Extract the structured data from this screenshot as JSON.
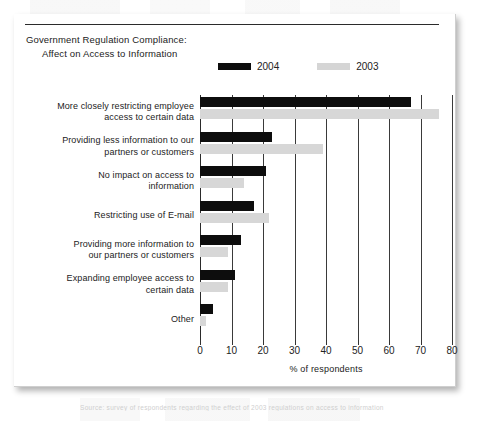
{
  "figure": {
    "title_line1": "Government Regulation Compliance:",
    "title_line2": "Affect on Access to Information",
    "caption": "Source: survey of respondents regarding the effect of 2003 regulations on access to information"
  },
  "legend": {
    "items": [
      {
        "label": "2004",
        "color": "#0d0d0d"
      },
      {
        "label": "2003",
        "color": "#d7d7d7"
      }
    ]
  },
  "chart_data": {
    "type": "bar",
    "orientation": "horizontal",
    "title": "Government Regulation Compliance: Affect on Access to Information",
    "xlabel": "% of respondents",
    "ylabel": "",
    "xlim": [
      0,
      80
    ],
    "xticks": [
      0,
      10,
      20,
      30,
      40,
      50,
      60,
      70,
      80
    ],
    "grid": true,
    "legend_position": "top-center",
    "categories": [
      "More closely restricting employee access to certain data",
      "Providing less information to our partners or customers",
      "No impact on access to information",
      "Restricting use of E-mail",
      "Providing more information to our partners or customers",
      "Expanding employee access to certain data",
      "Other"
    ],
    "series": [
      {
        "name": "2004",
        "color": "#0d0d0d",
        "values": [
          67,
          23,
          21,
          17,
          13,
          11,
          4
        ]
      },
      {
        "name": "2003",
        "color": "#d7d7d7",
        "values": [
          76,
          39,
          14,
          22,
          9,
          9,
          2
        ]
      }
    ]
  },
  "category_labels": [
    {
      "line1": "More closely restricting employee",
      "line2": "access to certain data"
    },
    {
      "line1": "Providing less information to our",
      "line2": "partners or customers"
    },
    {
      "line1": "No impact on access to",
      "line2": "information"
    },
    {
      "line1": "Restricting use of E-mail",
      "line2": ""
    },
    {
      "line1": "Providing more information to",
      "line2": "our partners or customers"
    },
    {
      "line1": "Expanding employee access to",
      "line2": "certain data"
    },
    {
      "line1": "Other",
      "line2": ""
    }
  ]
}
